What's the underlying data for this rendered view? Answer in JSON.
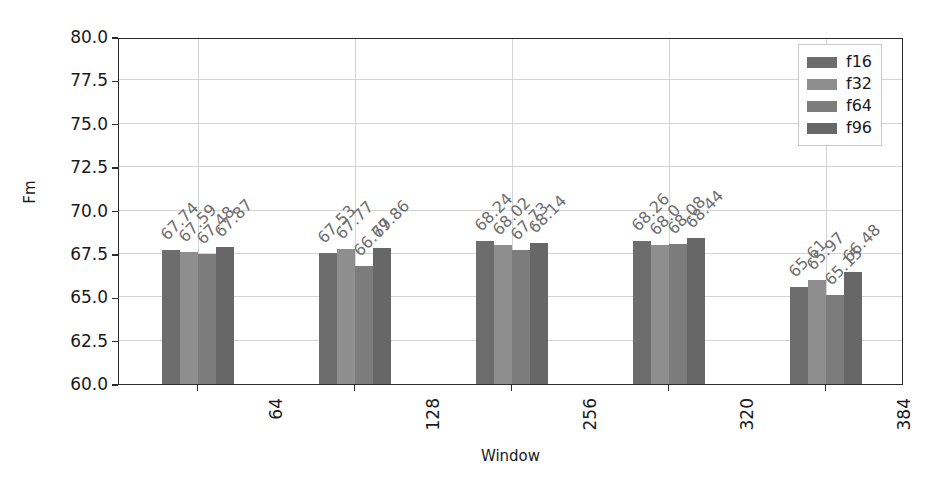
{
  "chart_data": {
    "type": "bar",
    "title": "",
    "xlabel": "Window",
    "ylabel": "Fm",
    "categories": [
      "64",
      "128",
      "256",
      "320",
      "384"
    ],
    "ylim": [
      60.0,
      80.0
    ],
    "yticks": [
      "60.0",
      "62.5",
      "65.0",
      "67.5",
      "70.0",
      "72.5",
      "75.0",
      "77.5",
      "80.0"
    ],
    "grid": true,
    "legend_position": "upper right",
    "series": [
      {
        "name": "f16",
        "color": "#6d6d6d",
        "values": [
          67.74,
          67.53,
          68.24,
          68.26,
          65.61
        ],
        "labels": [
          "67.74",
          "67.53",
          "68.24",
          "68.26",
          "65.61"
        ]
      },
      {
        "name": "f32",
        "color": "#8e8e8e",
        "values": [
          67.59,
          67.77,
          68.02,
          68.0,
          65.97
        ],
        "labels": [
          "67.59",
          "67.77",
          "68.02",
          "68.0",
          "65.97"
        ]
      },
      {
        "name": "f64",
        "color": "#7c7c7c",
        "values": [
          67.48,
          66.79,
          67.73,
          68.08,
          65.15
        ],
        "labels": [
          "67.48",
          "66.79",
          "67.73",
          "68.08",
          "65.15"
        ]
      },
      {
        "name": "f96",
        "color": "#676767",
        "values": [
          67.87,
          67.86,
          68.14,
          68.44,
          66.48
        ],
        "labels": [
          "67.87",
          "67.86",
          "68.14",
          "68.44",
          "66.48"
        ]
      }
    ]
  }
}
